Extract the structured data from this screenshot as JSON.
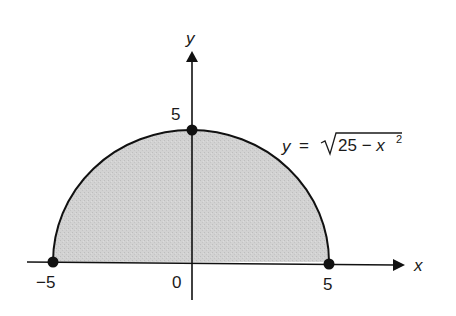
{
  "diagram": {
    "type": "semicircle-region",
    "equation": {
      "lhs": "y",
      "eq": "=",
      "radicand": "25 − x",
      "exponent": "2"
    },
    "axes": {
      "x_label": "x",
      "y_label": "y"
    },
    "ticks": {
      "x_neg": "−5",
      "origin": "0",
      "x_pos": "5",
      "y_top": "5"
    },
    "points": [
      {
        "x": -5,
        "y": 0
      },
      {
        "x": 0,
        "y": 5
      },
      {
        "x": 5,
        "y": 0
      }
    ],
    "colors": {
      "fill": "#cfcfcf",
      "stroke": "#111111"
    }
  },
  "chart_data": {
    "type": "area",
    "title": "",
    "function": "y = sqrt(25 - x^2)",
    "x": [
      -5,
      -4,
      -3,
      -2,
      -1,
      0,
      1,
      2,
      3,
      4,
      5
    ],
    "values": [
      0,
      3,
      4,
      4.58,
      4.9,
      5,
      4.9,
      4.58,
      4,
      3,
      0
    ],
    "xlabel": "x",
    "ylabel": "y",
    "xlim": [
      -5,
      5
    ],
    "ylim": [
      0,
      5
    ],
    "tick_labels": {
      "x": [
        "−5",
        "0",
        "5"
      ],
      "y": [
        "5"
      ]
    },
    "marked_points": [
      [
        -5,
        0
      ],
      [
        0,
        5
      ],
      [
        5,
        0
      ]
    ],
    "grid": false,
    "legend": null
  }
}
